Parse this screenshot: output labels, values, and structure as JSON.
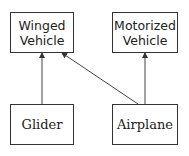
{
  "diagram": {
    "type": "inheritance",
    "nodes": [
      {
        "id": "winged",
        "label_line1": "Winged",
        "label_line2": "Vehicle"
      },
      {
        "id": "motorized",
        "label_line1": "Motorized",
        "label_line2": "Vehicle"
      },
      {
        "id": "glider",
        "label": "Glider"
      },
      {
        "id": "airplane",
        "label": "Airplane"
      }
    ],
    "edges": [
      {
        "from": "glider",
        "to": "winged"
      },
      {
        "from": "airplane",
        "to": "winged"
      },
      {
        "from": "airplane",
        "to": "motorized"
      }
    ]
  }
}
